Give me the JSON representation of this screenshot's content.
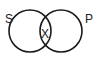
{
  "diagram": {
    "type": "venn",
    "sets": [
      {
        "label": "S",
        "cx": 30,
        "cy": 31,
        "r": 21
      },
      {
        "label": "P",
        "cx": 61,
        "cy": 31,
        "r": 21
      }
    ],
    "intersection_label": "X",
    "stroke_color": "#1a1a1a",
    "label_color": "#222222",
    "background": "#ffffff"
  }
}
